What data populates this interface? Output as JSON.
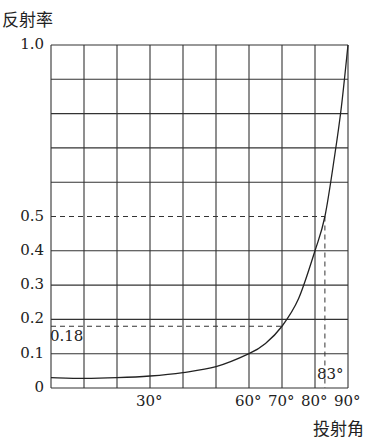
{
  "chart_data": {
    "type": "line",
    "title": "",
    "ylabel": "反射率",
    "xlabel": "投射角",
    "xlim": [
      0,
      90
    ],
    "ylim": [
      0,
      1.0
    ],
    "grid": true,
    "x_grid_step": 10,
    "y_grid_step": 0.1,
    "x_tick_labels": [
      {
        "value": 30,
        "label": "30°"
      },
      {
        "value": 60,
        "label": "60°"
      },
      {
        "value": 70,
        "label": "70°"
      },
      {
        "value": 80,
        "label": "80°"
      },
      {
        "value": 90,
        "label": "90°"
      }
    ],
    "y_tick_labels": [
      {
        "value": 0,
        "label": "0"
      },
      {
        "value": 0.1,
        "label": "0.1"
      },
      {
        "value": 0.2,
        "label": "0.2"
      },
      {
        "value": 0.3,
        "label": "0.3"
      },
      {
        "value": 0.4,
        "label": "0.4"
      },
      {
        "value": 0.5,
        "label": "0.5"
      },
      {
        "value": 1.0,
        "label": "1.0"
      }
    ],
    "series": [
      {
        "name": "反射率",
        "x": [
          0,
          10,
          20,
          30,
          40,
          50,
          60,
          65,
          70,
          75,
          80,
          83,
          86,
          88,
          90
        ],
        "y": [
          0.03,
          0.028,
          0.03,
          0.035,
          0.045,
          0.062,
          0.1,
          0.13,
          0.18,
          0.26,
          0.4,
          0.5,
          0.68,
          0.82,
          1.0
        ]
      }
    ],
    "annotations": [
      {
        "type": "hline-dashed",
        "y": 0.5,
        "x_to": 83
      },
      {
        "type": "hline-dashed",
        "y": 0.18,
        "x_to": 70,
        "label": "0.18"
      },
      {
        "type": "vline-dashed",
        "x": 83,
        "y_to": 0.5,
        "label": "83°"
      }
    ]
  },
  "labels": {
    "y_title": "反射率",
    "x_title": "投射角",
    "ann_018": "0.18",
    "ann_83": "83°"
  }
}
